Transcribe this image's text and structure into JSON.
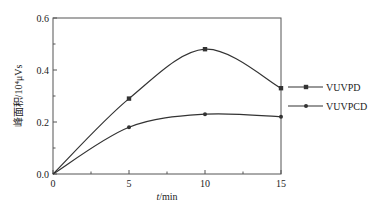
{
  "chart_data": {
    "type": "line",
    "title": "",
    "xlabel": "t/min",
    "xlabel_italic_part": "t",
    "xlabel_unit_part": "/min",
    "ylabel": "峰面积/10⁴μVs",
    "x": [
      0,
      5,
      10,
      15
    ],
    "xlim": [
      0,
      15
    ],
    "ylim": [
      0,
      0.6
    ],
    "xticks": [
      "0",
      "5",
      "10",
      "15"
    ],
    "yticks": [
      "0.0",
      "0.2",
      "0.4",
      "0.6"
    ],
    "grid": false,
    "legend_position": "right-outside",
    "series": [
      {
        "name": "VUVPD",
        "marker": "square",
        "values": [
          0,
          0.29,
          0.48,
          0.33
        ]
      },
      {
        "name": "VUVPCD",
        "marker": "circle",
        "values": [
          0,
          0.18,
          0.23,
          0.22
        ]
      }
    ]
  },
  "colors": {
    "line": "#333333",
    "axis": "#555555",
    "text": "#222222"
  }
}
